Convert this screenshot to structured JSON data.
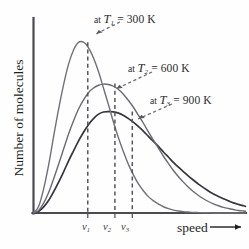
{
  "chart_data": {
    "type": "line",
    "title": "",
    "xlabel": "speed",
    "ylabel": "Number of molecules",
    "grid": false,
    "legend_position": "inline-annotations",
    "xlim": [
      0,
      1
    ],
    "ylim": [
      0,
      1
    ],
    "axis_ticks_numeric": false,
    "x_tick_labels": [
      "v1",
      "v2",
      "v3"
    ],
    "annotations": [
      {
        "id": "t1",
        "text": "at T1 = 300 K",
        "prefix": "at ",
        "symbol": "T",
        "subscript": "1",
        "equals": " = ",
        "value": "300 K"
      },
      {
        "id": "t2",
        "text": "at T2 = 600 K",
        "prefix": "at ",
        "symbol": "T",
        "subscript": "2",
        "equals": " = ",
        "value": "600 K"
      },
      {
        "id": "t3",
        "text": "at T3 = 900 K",
        "prefix": "at ",
        "symbol": "T",
        "subscript": "3",
        "equals": " = ",
        "value": "900 K"
      }
    ],
    "series": [
      {
        "name": "at T1 = 300 K",
        "temperature_K": 300,
        "color": "#70707a",
        "peak_x": 0.256,
        "peak_y": 0.876,
        "most_probable_speed_label": "v1",
        "x": [
          0.0,
          0.024,
          0.047,
          0.071,
          0.094,
          0.118,
          0.142,
          0.165,
          0.189,
          0.212,
          0.236,
          0.259,
          0.283,
          0.307,
          0.33,
          0.354,
          0.377,
          0.401,
          0.425,
          0.448,
          0.472,
          0.495,
          0.519,
          0.542,
          0.566,
          0.59,
          0.613,
          0.637,
          0.66,
          0.684,
          0.708,
          0.731,
          0.755,
          0.778,
          0.802,
          0.825,
          0.849,
          0.873,
          0.896,
          0.92,
          0.943,
          0.967,
          0.991,
          1.0
        ],
        "y": [
          0.0,
          0.033,
          0.12,
          0.244,
          0.387,
          0.53,
          0.658,
          0.762,
          0.836,
          0.875,
          0.876,
          0.848,
          0.795,
          0.724,
          0.641,
          0.554,
          0.467,
          0.385,
          0.312,
          0.248,
          0.194,
          0.149,
          0.113,
          0.084,
          0.062,
          0.045,
          0.032,
          0.022,
          0.015,
          0.01,
          0.007,
          0.005,
          0.003,
          0.002,
          0.001,
          0.001,
          0.0,
          0.0,
          0.0,
          0.0,
          0.0,
          0.0,
          0.0,
          0.0
        ]
      },
      {
        "name": "at T2 = 600 K",
        "temperature_K": 600,
        "color": "#6a6a74",
        "peak_x": 0.384,
        "peak_y": 0.664,
        "most_probable_speed_label": "v2",
        "x": [
          0.0,
          0.024,
          0.047,
          0.071,
          0.094,
          0.118,
          0.142,
          0.165,
          0.189,
          0.212,
          0.236,
          0.259,
          0.283,
          0.307,
          0.33,
          0.354,
          0.377,
          0.401,
          0.425,
          0.448,
          0.472,
          0.495,
          0.519,
          0.542,
          0.566,
          0.59,
          0.613,
          0.637,
          0.66,
          0.684,
          0.708,
          0.731,
          0.755,
          0.778,
          0.802,
          0.825,
          0.849,
          0.873,
          0.896,
          0.92,
          0.943,
          0.967,
          0.991,
          1.0
        ],
        "y": [
          0.0,
          0.013,
          0.049,
          0.104,
          0.172,
          0.249,
          0.328,
          0.404,
          0.473,
          0.532,
          0.58,
          0.617,
          0.641,
          0.655,
          0.661,
          0.659,
          0.65,
          0.633,
          0.608,
          0.577,
          0.541,
          0.501,
          0.459,
          0.416,
          0.373,
          0.331,
          0.291,
          0.253,
          0.218,
          0.186,
          0.157,
          0.132,
          0.109,
          0.09,
          0.073,
          0.059,
          0.047,
          0.037,
          0.029,
          0.023,
          0.018,
          0.013,
          0.01,
          0.009
        ]
      },
      {
        "name": "at T3 = 900 K",
        "temperature_K": 900,
        "color": "#35353f",
        "peak_x": 0.466,
        "peak_y": 0.52,
        "most_probable_speed_label": "v3",
        "x": [
          0.0,
          0.024,
          0.047,
          0.071,
          0.094,
          0.118,
          0.142,
          0.165,
          0.189,
          0.212,
          0.236,
          0.259,
          0.283,
          0.307,
          0.33,
          0.354,
          0.377,
          0.401,
          0.425,
          0.448,
          0.472,
          0.495,
          0.519,
          0.542,
          0.566,
          0.59,
          0.613,
          0.637,
          0.66,
          0.684,
          0.708,
          0.731,
          0.755,
          0.778,
          0.802,
          0.825,
          0.849,
          0.873,
          0.896,
          0.92,
          0.943,
          0.967,
          0.991,
          1.0
        ],
        "y": [
          0.0,
          0.008,
          0.03,
          0.064,
          0.107,
          0.157,
          0.211,
          0.266,
          0.319,
          0.369,
          0.414,
          0.453,
          0.484,
          0.507,
          0.518,
          0.52,
          0.519,
          0.512,
          0.5,
          0.484,
          0.465,
          0.443,
          0.419,
          0.393,
          0.367,
          0.34,
          0.313,
          0.286,
          0.26,
          0.235,
          0.211,
          0.189,
          0.168,
          0.148,
          0.13,
          0.113,
          0.098,
          0.085,
          0.073,
          0.062,
          0.052,
          0.044,
          0.037,
          0.034
        ]
      }
    ],
    "dashed_peak_lines": [
      {
        "label": "v1",
        "x": 0.256,
        "top_y": 0.876
      },
      {
        "label": "v2",
        "x": 0.384,
        "top_y": 0.664
      },
      {
        "label": "v3",
        "x": 0.466,
        "top_y": 0.52
      }
    ],
    "colors": {
      "axis": "#4a4a50",
      "curve_t1": "#70707a",
      "curve_t2": "#6a6a74",
      "curve_t3": "#35353f",
      "dashed_line": "#55555c",
      "text": "#1f1f23",
      "background": "#fefefe"
    }
  }
}
